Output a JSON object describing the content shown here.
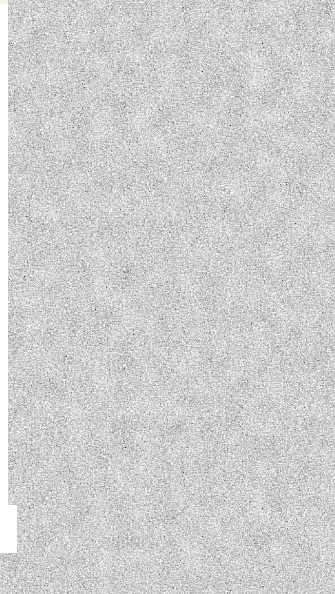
{
  "image": {
    "kind": "scanned-grayscale-texture",
    "subject": "fibrous grain plate",
    "width_px": 335,
    "height_px": 594,
    "has_text": false,
    "has_ui_chrome": false
  },
  "texture": {
    "description": "High-frequency speckled fibrous grain filling the full frame",
    "tone": "mid-gray with fine black and white filaments",
    "grain_scale_px": 1,
    "color_mode": "grayscale",
    "base_color": "#8a8a8a",
    "dark_color": "#141414",
    "light_color": "#f2f2f2",
    "contrast": "high",
    "coverage": "full-bleed to top, right and bottom edges"
  },
  "margins": {
    "left_strip": {
      "label": "left paper margin",
      "color": "#f4f3f0",
      "x": 0,
      "y": 4,
      "width": 8,
      "height": 502
    },
    "corner_notch": {
      "label": "lower-left blank notch",
      "color": "#fcfbf9",
      "x": 0,
      "y": 505,
      "width": 17,
      "height": 48
    },
    "top_hairline": {
      "label": "top-left hairline",
      "color": "#ddddd8",
      "x": 0,
      "y": 0,
      "width": 8,
      "height": 5
    }
  }
}
